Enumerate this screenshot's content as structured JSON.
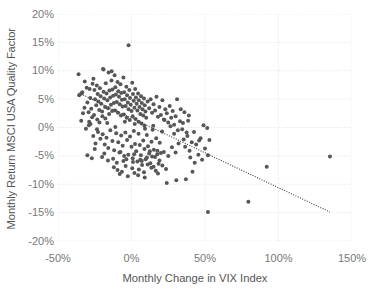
{
  "chart_data": {
    "type": "scatter",
    "title": "",
    "xlabel": "Monthly Change in VIX Index",
    "ylabel": "Monthly Return MSCI USA Quality Factor",
    "xlim": [
      -50,
      150
    ],
    "ylim": [
      -20,
      20
    ],
    "xticks": [
      -50,
      0,
      50,
      100,
      150
    ],
    "xticklabels": [
      "-50%",
      "0%",
      "50%",
      "100%",
      "150%"
    ],
    "yticks": [
      20,
      15,
      10,
      5,
      0,
      -5,
      -10,
      -15,
      -20
    ],
    "yticklabels": [
      "20%",
      "15%",
      "10%",
      "5%",
      "0%",
      "-5%",
      "-10%",
      "-15%",
      "-20%"
    ],
    "grid": true,
    "grid_style": "dotted",
    "grid_color": "#e3e3e3",
    "legend": "none",
    "marker_color": "#575757",
    "marker_size": 4,
    "trendline": {
      "style": "dotted",
      "color": "#3a3a3a",
      "x_start": -36,
      "y_start": 6.1,
      "x_end": 135,
      "y_end": -14.9
    },
    "points": [
      [
        -36.0,
        9.4
      ],
      [
        -33.5,
        6.2
      ],
      [
        -35.6,
        5.7
      ],
      [
        -33.0,
        2.5
      ],
      [
        -34.2,
        1.2
      ],
      [
        -31.8,
        8.1
      ],
      [
        -30.5,
        7.0
      ],
      [
        -30.0,
        4.4
      ],
      [
        -29.2,
        2.7
      ],
      [
        -31.0,
        -0.2
      ],
      [
        -28.5,
        6.8
      ],
      [
        -28.0,
        5.2
      ],
      [
        -27.4,
        3.3
      ],
      [
        -26.8,
        1.8
      ],
      [
        -27.9,
        0.6
      ],
      [
        -25.9,
        8.6
      ],
      [
        -25.2,
        6.6
      ],
      [
        -24.8,
        5.0
      ],
      [
        -24.0,
        3.9
      ],
      [
        -25.5,
        2.2
      ],
      [
        -23.6,
        7.4
      ],
      [
        -23.0,
        5.9
      ],
      [
        -22.5,
        4.6
      ],
      [
        -22.0,
        3.1
      ],
      [
        -23.3,
        1.4
      ],
      [
        -21.5,
        6.9
      ],
      [
        -21.0,
        5.5
      ],
      [
        -20.6,
        4.2
      ],
      [
        -20.0,
        2.8
      ],
      [
        -21.8,
        0.9
      ],
      [
        -19.4,
        10.3
      ],
      [
        -19.0,
        6.3
      ],
      [
        -18.6,
        5.1
      ],
      [
        -18.0,
        3.6
      ],
      [
        -19.8,
        2.0
      ],
      [
        -17.5,
        7.8
      ],
      [
        -17.0,
        6.0
      ],
      [
        -16.4,
        4.8
      ],
      [
        -16.0,
        3.4
      ],
      [
        -17.8,
        1.6
      ],
      [
        -15.6,
        9.7
      ],
      [
        -15.0,
        6.5
      ],
      [
        -14.5,
        5.3
      ],
      [
        -14.0,
        4.0
      ],
      [
        -15.2,
        2.4
      ],
      [
        -13.6,
        8.3
      ],
      [
        -13.0,
        6.7
      ],
      [
        -12.5,
        5.6
      ],
      [
        -12.0,
        4.3
      ],
      [
        -13.2,
        2.9
      ],
      [
        -11.5,
        9.2
      ],
      [
        -11.0,
        7.1
      ],
      [
        -10.6,
        5.8
      ],
      [
        -10.0,
        4.5
      ],
      [
        -11.2,
        3.0
      ],
      [
        -9.5,
        8.0
      ],
      [
        -9.0,
        6.4
      ],
      [
        -8.5,
        5.4
      ],
      [
        -8.0,
        4.1
      ],
      [
        -9.2,
        2.6
      ],
      [
        -7.5,
        7.6
      ],
      [
        -7.0,
        6.1
      ],
      [
        -6.5,
        4.9
      ],
      [
        -6.0,
        3.7
      ],
      [
        -7.2,
        2.1
      ],
      [
        -5.5,
        8.8
      ],
      [
        -5.0,
        6.2
      ],
      [
        -4.6,
        5.0
      ],
      [
        -4.0,
        3.8
      ],
      [
        -5.2,
        2.3
      ],
      [
        -3.5,
        7.2
      ],
      [
        -3.0,
        5.7
      ],
      [
        -2.5,
        4.4
      ],
      [
        -2.0,
        3.2
      ],
      [
        -3.2,
        1.7
      ],
      [
        -1.5,
        6.6
      ],
      [
        -1.0,
        5.2
      ],
      [
        -0.5,
        4.0
      ],
      [
        0.0,
        2.9
      ],
      [
        -1.2,
        1.3
      ],
      [
        0.5,
        7.9
      ],
      [
        1.0,
        5.9
      ],
      [
        1.5,
        4.7
      ],
      [
        2.0,
        3.5
      ],
      [
        0.8,
        2.0
      ],
      [
        2.5,
        6.8
      ],
      [
        3.0,
        5.3
      ],
      [
        3.5,
        4.2
      ],
      [
        4.0,
        3.0
      ],
      [
        2.8,
        1.5
      ],
      [
        4.5,
        6.0
      ],
      [
        5.0,
        4.8
      ],
      [
        5.5,
        3.6
      ],
      [
        6.0,
        2.4
      ],
      [
        4.8,
        1.0
      ],
      [
        6.5,
        5.5
      ],
      [
        7.0,
        4.3
      ],
      [
        7.5,
        3.2
      ],
      [
        8.0,
        2.1
      ],
      [
        6.8,
        0.7
      ],
      [
        8.5,
        5.1
      ],
      [
        9.0,
        3.9
      ],
      [
        9.5,
        2.8
      ],
      [
        10.0,
        1.7
      ],
      [
        8.8,
        0.3
      ],
      [
        -2.0,
        14.5
      ],
      [
        -19.0,
        10.2
      ],
      [
        -13.5,
        9.9
      ],
      [
        -26.0,
        -1.5
      ],
      [
        -24.5,
        -2.8
      ],
      [
        -22.8,
        -0.8
      ],
      [
        -21.2,
        -2.0
      ],
      [
        -19.6,
        -1.2
      ],
      [
        -18.2,
        -3.0
      ],
      [
        -17.0,
        -1.8
      ],
      [
        -15.8,
        -3.6
      ],
      [
        -14.4,
        -0.5
      ],
      [
        -13.0,
        -2.4
      ],
      [
        -11.8,
        -4.0
      ],
      [
        -10.4,
        -1.0
      ],
      [
        -9.0,
        -2.6
      ],
      [
        -8.2,
        -4.4
      ],
      [
        -7.0,
        -1.4
      ],
      [
        -6.0,
        -3.2
      ],
      [
        -5.0,
        -5.0
      ],
      [
        -4.2,
        -0.9
      ],
      [
        -3.0,
        -2.2
      ],
      [
        -2.2,
        -4.8
      ],
      [
        -1.0,
        -1.6
      ],
      [
        0.0,
        -3.4
      ],
      [
        0.8,
        -5.4
      ],
      [
        1.6,
        -0.6
      ],
      [
        2.4,
        -2.9
      ],
      [
        3.2,
        -4.2
      ],
      [
        4.0,
        -6.0
      ],
      [
        4.8,
        -1.1
      ],
      [
        5.6,
        -3.1
      ],
      [
        6.4,
        -4.9
      ],
      [
        7.2,
        -6.6
      ],
      [
        8.0,
        -2.3
      ],
      [
        8.8,
        -3.8
      ],
      [
        9.6,
        -5.6
      ],
      [
        10.4,
        -1.3
      ],
      [
        11.2,
        -3.3
      ],
      [
        12.0,
        -4.6
      ],
      [
        12.8,
        -6.3
      ],
      [
        13.6,
        -2.5
      ],
      [
        14.4,
        -0.4
      ],
      [
        15.2,
        -3.9
      ],
      [
        16.0,
        -5.2
      ],
      [
        16.8,
        -1.9
      ],
      [
        17.6,
        -4.1
      ],
      [
        18.4,
        -6.4
      ],
      [
        19.2,
        -2.7
      ],
      [
        20.0,
        -4.5
      ],
      [
        20.8,
        -0.7
      ],
      [
        11.0,
        4.6
      ],
      [
        12.0,
        3.4
      ],
      [
        13.0,
        5.0
      ],
      [
        14.0,
        2.6
      ],
      [
        15.0,
        4.1
      ],
      [
        16.0,
        3.0
      ],
      [
        17.0,
        5.4
      ],
      [
        18.0,
        1.9
      ],
      [
        19.0,
        3.6
      ],
      [
        20.0,
        2.2
      ],
      [
        21.0,
        4.8
      ],
      [
        22.0,
        1.4
      ],
      [
        23.0,
        3.2
      ],
      [
        24.0,
        2.5
      ],
      [
        25.0,
        0.9
      ],
      [
        26.0,
        3.8
      ],
      [
        27.0,
        1.7
      ],
      [
        28.0,
        2.9
      ],
      [
        29.0,
        0.5
      ],
      [
        30.0,
        2.0
      ],
      [
        -16.0,
        -5.8
      ],
      [
        -12.0,
        -7.0
      ],
      [
        -10.0,
        -6.2
      ],
      [
        -6.5,
        -7.8
      ],
      [
        -4.0,
        -6.8
      ],
      [
        0.5,
        -7.2
      ],
      [
        2.0,
        -8.0
      ],
      [
        5.0,
        -7.4
      ],
      [
        8.5,
        -7.9
      ],
      [
        11.0,
        -6.5
      ],
      [
        13.5,
        -7.1
      ],
      [
        16.5,
        -7.6
      ],
      [
        -8.0,
        -8.2
      ],
      [
        -2.5,
        -8.6
      ],
      [
        4.5,
        -8.4
      ],
      [
        9.0,
        -8.8
      ],
      [
        15.0,
        -6.9
      ],
      [
        18.0,
        -8.1
      ],
      [
        21.0,
        -6.7
      ],
      [
        23.5,
        -7.3
      ],
      [
        -9.5,
        -7.5
      ],
      [
        -5.5,
        -5.9
      ],
      [
        1.0,
        -6.1
      ],
      [
        6.0,
        -5.7
      ],
      [
        10.5,
        -5.3
      ],
      [
        14.0,
        -5.1
      ],
      [
        17.5,
        -4.7
      ],
      [
        22.0,
        -4.3
      ],
      [
        25.0,
        -5.0
      ],
      [
        27.5,
        -3.5
      ],
      [
        30.0,
        -4.4
      ],
      [
        32.0,
        -2.8
      ],
      [
        24.0,
        -9.8
      ],
      [
        30.5,
        -9.3
      ],
      [
        37.0,
        -9.1
      ],
      [
        31.0,
        5.0
      ],
      [
        33.0,
        1.1
      ],
      [
        34.5,
        -0.3
      ],
      [
        35.5,
        -2.1
      ],
      [
        36.5,
        -3.4
      ],
      [
        38.0,
        -1.5
      ],
      [
        39.5,
        -4.1
      ],
      [
        41.0,
        -2.6
      ],
      [
        42.5,
        -0.8
      ],
      [
        44.0,
        -3.0
      ],
      [
        45.5,
        -4.8
      ],
      [
        47.0,
        -1.9
      ],
      [
        36.0,
        2.7
      ],
      [
        38.5,
        1.2
      ],
      [
        40.0,
        -5.3
      ],
      [
        43.0,
        -6.2
      ],
      [
        41.5,
        -7.8
      ],
      [
        46.0,
        -2.3
      ],
      [
        48.0,
        -5.7
      ],
      [
        50.0,
        -3.7
      ],
      [
        51.5,
        -0.1
      ],
      [
        53.0,
        -2.2
      ],
      [
        49.0,
        0.4
      ],
      [
        52.0,
        -4.9
      ],
      [
        22.5,
        1.3
      ],
      [
        26.5,
        0.2
      ],
      [
        29.0,
        -1.1
      ],
      [
        31.5,
        -0.5
      ],
      [
        33.5,
        3.2
      ],
      [
        35.0,
        0.8
      ],
      [
        37.5,
        -0.9
      ],
      [
        39.0,
        2.1
      ],
      [
        52.0,
        -14.9
      ],
      [
        79.5,
        -13.1
      ],
      [
        92.0,
        -6.9
      ],
      [
        135.0,
        -5.1
      ],
      [
        -30.0,
        -4.9
      ],
      [
        -27.0,
        -5.4
      ],
      [
        -20.0,
        -5.2
      ],
      [
        -25.0,
        -3.8
      ],
      [
        -18.5,
        -4.6
      ],
      [
        -12.5,
        -5.5
      ],
      [
        -7.5,
        -4.3
      ],
      [
        -3.5,
        -5.6
      ],
      [
        1.8,
        -4.7
      ],
      [
        7.0,
        -5.9
      ],
      [
        12.5,
        -4.2
      ],
      [
        19.0,
        -5.8
      ],
      [
        -29.0,
        0.4
      ],
      [
        -23.5,
        -0.3
      ],
      [
        -16.5,
        0.8
      ],
      [
        -11.0,
        0.1
      ],
      [
        -4.5,
        1.0
      ],
      [
        2.2,
        0.6
      ],
      [
        9.2,
        -0.2
      ],
      [
        14.8,
        0.3
      ],
      [
        -34.0,
        6.0
      ],
      [
        -32.0,
        3.5
      ],
      [
        -28.8,
        1.0
      ],
      [
        -26.5,
        7.7
      ]
    ]
  }
}
